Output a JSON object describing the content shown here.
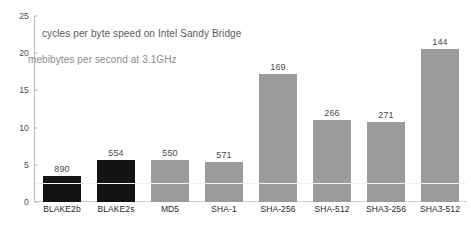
{
  "chart_data": {
    "type": "bar",
    "title": "cycles per byte speed on Intel Sandy Bridge",
    "subtitle": "mebibytes per second at 3.1GHz",
    "xlabel": "",
    "ylabel": "",
    "ylim": [
      0,
      25
    ],
    "yticks": [
      0,
      5,
      10,
      15,
      20,
      25
    ],
    "grid": false,
    "legend": null,
    "categories": [
      "BLAKE2b",
      "BLAKE2s",
      "MD5",
      "SHA-1",
      "SHA-256",
      "SHA-512",
      "SHA3-256",
      "SHA3-512"
    ],
    "values": [
      3.5,
      5.6,
      5.6,
      5.4,
      17.2,
      11.0,
      10.8,
      20.5
    ],
    "data_labels": [
      "890",
      "554",
      "550",
      "571",
      "169",
      "266",
      "271",
      "144"
    ],
    "bar_colors": [
      "#131313",
      "#131313",
      "#9b9b9b",
      "#9b9b9b",
      "#9b9b9b",
      "#9b9b9b",
      "#9b9b9b",
      "#9b9b9b"
    ],
    "series": [
      {
        "name": "cycles per byte",
        "values": [
          3.5,
          5.6,
          5.6,
          5.4,
          17.2,
          11.0,
          10.8,
          20.5
        ]
      },
      {
        "name": "mebibytes per second at 3.1GHz",
        "values": [
          890,
          554,
          550,
          571,
          169,
          266,
          271,
          144
        ]
      }
    ]
  },
  "axis": {
    "y_tick_labels": [
      "0",
      "5",
      "10",
      "15",
      "20",
      "25"
    ]
  },
  "colors": {
    "bar_dark": "#131313",
    "bar_gray": "#9b9b9b",
    "axis": "#b9b9b9",
    "text": "#4a4a4a",
    "annotation": "#6e6e6e",
    "background": "#ffffff"
  }
}
